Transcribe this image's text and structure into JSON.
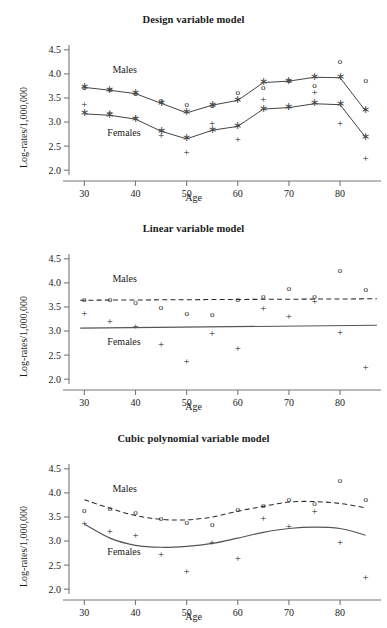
{
  "figure": {
    "panel_count": 3
  },
  "axis": {
    "xlabel": "Age",
    "ylabel": "Log-rates/1,000,000",
    "xticks": [
      30,
      40,
      50,
      60,
      70,
      80
    ],
    "xtick_labels": [
      "30",
      "40",
      "50",
      "60",
      "70",
      "80"
    ],
    "yticks": [
      2.0,
      2.5,
      3.0,
      3.5,
      4.0,
      4.5
    ],
    "ytick_labels": [
      "2.0",
      "2.5",
      "3.0",
      "3.5",
      "4.0",
      "4.5"
    ],
    "xlim": [
      27,
      88
    ],
    "ylim": [
      1.9,
      4.6
    ]
  },
  "labels": {
    "males": "Males",
    "females": "Females"
  },
  "panels": [
    {
      "title": "Design variable model"
    },
    {
      "title": "Linear variable model"
    },
    {
      "title": "Cubic polynomial variable model"
    }
  ],
  "chart_data": [
    {
      "type": "scatter",
      "title": "Design variable model",
      "xlabel": "Age",
      "ylabel": "Log-rates/1,000,000",
      "xlim": [
        27,
        88
      ],
      "ylim": [
        1.9,
        4.6
      ],
      "grid": false,
      "legend_position": "inline-annotation",
      "annotations": [
        "Males",
        "Females"
      ],
      "x": [
        30,
        35,
        40,
        45,
        50,
        55,
        60,
        65,
        70,
        75,
        80,
        85
      ],
      "series": [
        {
          "name": "Males observed",
          "marker": "o",
          "values": [
            3.7,
            3.66,
            3.59,
            3.44,
            3.36,
            3.33,
            3.61,
            3.7,
            3.86,
            3.74,
            4.24,
            3.86
          ]
        },
        {
          "name": "Females observed",
          "marker": "+",
          "values": [
            3.35,
            3.18,
            3.08,
            2.69,
            2.35,
            2.94,
            2.61,
            3.44,
            3.29,
            3.59,
            2.95,
            2.23
          ]
        },
        {
          "name": "Males fitted (design variable)",
          "marker": "*",
          "connected": true,
          "line_style": "dashed",
          "values": [
            3.72,
            3.66,
            3.59,
            3.39,
            3.19,
            3.35,
            3.45,
            3.82,
            3.85,
            3.93,
            3.92,
            3.23
          ]
        },
        {
          "name": "Females fitted (design variable)",
          "marker": "*",
          "connected": true,
          "line_style": "dashed",
          "values": [
            3.17,
            3.14,
            3.06,
            2.81,
            2.65,
            2.83,
            2.91,
            3.27,
            3.3,
            3.38,
            3.36,
            2.68
          ]
        }
      ]
    },
    {
      "type": "scatter",
      "title": "Linear variable model",
      "xlabel": "Age",
      "ylabel": "Log-rates/1,000,000",
      "xlim": [
        27,
        88
      ],
      "ylim": [
        1.9,
        4.6
      ],
      "grid": false,
      "legend_position": "inline-annotation",
      "annotations": [
        "Males",
        "Females"
      ],
      "x": [
        30,
        35,
        40,
        45,
        50,
        55,
        60,
        65,
        70,
        75,
        80,
        85
      ],
      "series": [
        {
          "name": "Males observed",
          "marker": "o",
          "values": [
            3.64,
            3.65,
            3.59,
            3.48,
            3.36,
            3.33,
            3.64,
            3.7,
            3.87,
            3.7,
            4.24,
            3.86
          ]
        },
        {
          "name": "Females observed",
          "marker": "+",
          "values": [
            3.35,
            3.18,
            3.08,
            2.69,
            2.35,
            2.93,
            2.61,
            3.44,
            3.29,
            3.6,
            2.95,
            2.23
          ]
        },
        {
          "name": "Males fitted (linear)",
          "line_style": "dashed",
          "fit_endpoints_y": [
            3.64,
            3.67
          ]
        },
        {
          "name": "Females fitted (linear)",
          "line_style": "solid",
          "fit_endpoints_y": [
            3.06,
            3.12
          ]
        }
      ]
    },
    {
      "type": "scatter",
      "title": "Cubic polynomial variable model",
      "xlabel": "Age",
      "ylabel": "Log-rates/1,000,000",
      "xlim": [
        27,
        88
      ],
      "ylim": [
        1.9,
        4.6
      ],
      "grid": false,
      "legend_position": "inline-annotation",
      "annotations": [
        "Males",
        "Females"
      ],
      "x": [
        30,
        35,
        40,
        45,
        50,
        55,
        60,
        65,
        70,
        75,
        80,
        85
      ],
      "series": [
        {
          "name": "Males observed",
          "marker": "o",
          "values": [
            3.63,
            3.66,
            3.58,
            3.45,
            3.38,
            3.33,
            3.65,
            3.72,
            3.85,
            3.77,
            4.24,
            3.86
          ]
        },
        {
          "name": "Females observed",
          "marker": "+",
          "values": [
            3.35,
            3.18,
            3.09,
            2.69,
            2.35,
            2.94,
            2.61,
            3.44,
            3.29,
            3.6,
            2.95,
            2.23
          ]
        },
        {
          "name": "Males fitted (cubic polynomial)",
          "line_style": "dashed",
          "fit_x": [
            30,
            35,
            40,
            45,
            50,
            55,
            60,
            65,
            70,
            75,
            80,
            85
          ],
          "fit_values": [
            3.86,
            3.68,
            3.53,
            3.45,
            3.44,
            3.5,
            3.62,
            3.72,
            3.81,
            3.82,
            3.78,
            3.69
          ]
        },
        {
          "name": "Females fitted (cubic polynomial)",
          "line_style": "solid",
          "fit_x": [
            30,
            35,
            40,
            45,
            50,
            55,
            60,
            65,
            70,
            75,
            80,
            85
          ],
          "fit_values": [
            3.35,
            3.06,
            2.91,
            2.87,
            2.89,
            2.95,
            3.06,
            3.18,
            3.26,
            3.29,
            3.26,
            3.12
          ]
        }
      ]
    }
  ]
}
